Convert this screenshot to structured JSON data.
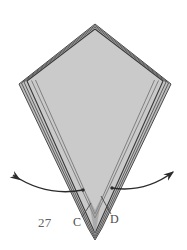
{
  "figure": {
    "number_label": "27",
    "type": "folded-paper-kite-diagram",
    "background_color": "#ffffff",
    "paper_fill_color": "#c9c9c9",
    "outline_color": "#3a3a3a",
    "fold_line_color": "#555555",
    "arrow_color": "#2b2b2b",
    "label_color": "#4a4a4a"
  },
  "vertices": {
    "top_apex": {
      "x": 95,
      "y": 24
    },
    "left_vertex": {
      "x": 24,
      "y": 82
    },
    "right_vertex": {
      "x": 166,
      "y": 82
    },
    "bottom_tip": {
      "x": 95,
      "y": 238
    }
  },
  "labels": [
    {
      "id": "label-c",
      "text": "C",
      "x": 73,
      "y": 215
    },
    {
      "id": "label-d",
      "text": "D",
      "x": 110,
      "y": 212
    },
    {
      "id": "figure-number",
      "text": "27",
      "x": 38,
      "y": 215
    }
  ],
  "leader_lines": [
    {
      "id": "leader-c",
      "from": {
        "x": 81,
        "y": 218
      },
      "to": {
        "x": 90,
        "y": 205
      }
    },
    {
      "id": "leader-d",
      "from": {
        "x": 111,
        "y": 215
      },
      "to": {
        "x": 101,
        "y": 197
      }
    }
  ],
  "arrows": [
    {
      "id": "arrow-left-unfold",
      "direction": "left",
      "start": {
        "x": 83,
        "y": 190
      },
      "end": {
        "x": 12,
        "y": 174
      },
      "control": {
        "x": 46,
        "y": 197
      }
    },
    {
      "id": "arrow-right-unfold",
      "direction": "right",
      "start": {
        "x": 112,
        "y": 188
      },
      "end": {
        "x": 174,
        "y": 171
      },
      "control": {
        "x": 145,
        "y": 192
      }
    }
  ],
  "fold_layers": {
    "count": 4,
    "description": "nested parallel fold edges along kite perimeter and lower V"
  }
}
